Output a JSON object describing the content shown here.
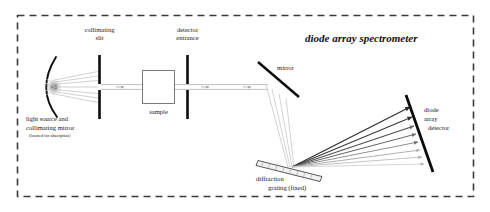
{
  "figure": {
    "title": "diode array spectrometer",
    "enclosure": {
      "style": "dashed",
      "color": "#3a3a3a"
    },
    "labels": {
      "collimating_slit_line1": "collimating",
      "collimating_slit_line2": "slit",
      "detector_entrance_line1": "detector",
      "detector_entrance_line2": "entrance",
      "sample": "sample",
      "mirror": "mirror",
      "light_source_line1": "light source and",
      "light_source_line2": "collimating mirror",
      "light_source_note": "(located for absorption)",
      "diffraction_grating_line1": "diffraction",
      "diffraction_grating_line2": "grating (fixed)",
      "diode_array_detector_line1": "diode",
      "diode_array_detector_line2": "array",
      "diode_array_detector_line3": "detector"
    },
    "colors": {
      "ink": "#1a1a1a",
      "optic_black": "#0d0d0d",
      "beam_grey": "#b4b4b4",
      "enclosure": "#3a3a3a",
      "source_glow": "#9a9a9a"
    },
    "components": [
      {
        "name": "light-source-collimating-mirror",
        "kind": "concave-mirror"
      },
      {
        "name": "collimating-slit",
        "kind": "slit"
      },
      {
        "name": "sample-cell",
        "kind": "rect"
      },
      {
        "name": "detector-entrance-slit",
        "kind": "slit"
      },
      {
        "name": "folding-mirror",
        "kind": "flat-mirror"
      },
      {
        "name": "diffraction-grating",
        "kind": "grating"
      },
      {
        "name": "diode-array-detector",
        "kind": "detector-bar"
      }
    ],
    "dispersed_rays": [
      {
        "order": 1,
        "shade": "#2b2b2b"
      },
      {
        "order": 2,
        "shade": "#3d3d3d"
      },
      {
        "order": 3,
        "shade": "#555555"
      },
      {
        "order": 4,
        "shade": "#6e6e6e"
      },
      {
        "order": 5,
        "shade": "#8a8a8a"
      },
      {
        "order": 6,
        "shade": "#a3a3a3"
      },
      {
        "order": 7,
        "shade": "#b9b9b9"
      },
      {
        "order": 8,
        "shade": "#cccccc"
      }
    ]
  }
}
